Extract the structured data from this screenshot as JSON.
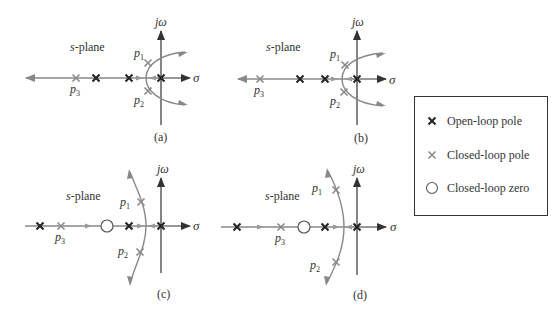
{
  "figure": {
    "plane_label": "s-plane",
    "axis_imag": "jω",
    "axis_real": "σ",
    "panels": [
      {
        "id": "a",
        "caption": "(a)",
        "pole_labels": [
          "p1",
          "p2",
          "p3"
        ]
      },
      {
        "id": "b",
        "caption": "(b)",
        "pole_labels": [
          "p1",
          "p2",
          "p3"
        ]
      },
      {
        "id": "c",
        "caption": "(c)",
        "pole_labels": [
          "p1",
          "p2",
          "p3"
        ]
      },
      {
        "id": "d",
        "caption": "(d)",
        "pole_labels": [
          "p1",
          "p2",
          "p3"
        ]
      }
    ]
  },
  "legend": {
    "items": [
      {
        "icon": "open-loop-pole-x-icon",
        "label": "Open-loop pole",
        "color": "#222222"
      },
      {
        "icon": "closed-loop-pole-x-icon",
        "label": "Closed-loop pole",
        "color": "#888888"
      },
      {
        "icon": "closed-loop-zero-circle-icon",
        "label": "Closed-loop zero",
        "color": "#555555"
      }
    ]
  },
  "colors": {
    "axis": "#333333",
    "locus": "#888888",
    "open_pole": "#222222",
    "closed_pole": "#8a8a8a"
  }
}
